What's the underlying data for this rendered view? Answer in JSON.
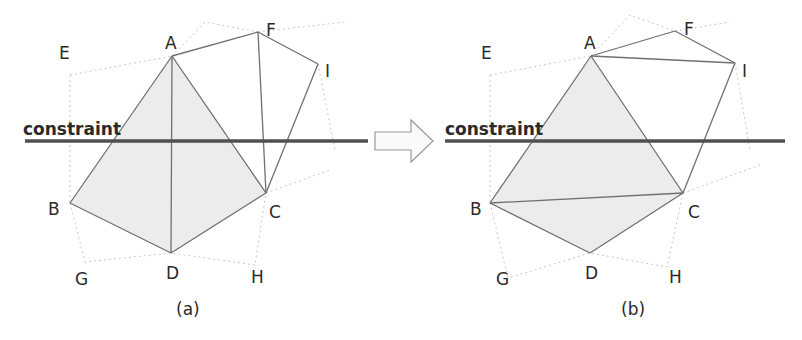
{
  "figure": {
    "constraint_label": "constraint",
    "arrow_icon": "right-arrow-icon",
    "colors": {
      "edge": "#707070",
      "constraint": "#505050",
      "shade": "#ececec",
      "dotted": "#c8c8c8",
      "text": "#2a2a2a"
    },
    "panels": [
      {
        "caption": "(a)",
        "vertices": {
          "A": "A",
          "B": "B",
          "C": "C",
          "D": "D",
          "E": "E",
          "F": "F",
          "G": "G",
          "H": "H",
          "I": "I"
        },
        "edges": [
          "A-F",
          "F-I",
          "A-B",
          "A-D",
          "A-C",
          "F-C",
          "I-C",
          "B-D",
          "D-C"
        ],
        "shaded_region": [
          "A",
          "B",
          "D",
          "C"
        ]
      },
      {
        "caption": "(b)",
        "vertices": {
          "A": "A",
          "B": "B",
          "C": "C",
          "D": "D",
          "E": "E",
          "F": "F",
          "G": "G",
          "H": "H",
          "I": "I"
        },
        "edges": [
          "A-F",
          "F-I",
          "A-I",
          "A-B",
          "A-C",
          "I-C",
          "B-C",
          "B-D",
          "D-C"
        ],
        "shaded_region": [
          "A",
          "B",
          "D",
          "C"
        ]
      }
    ]
  }
}
